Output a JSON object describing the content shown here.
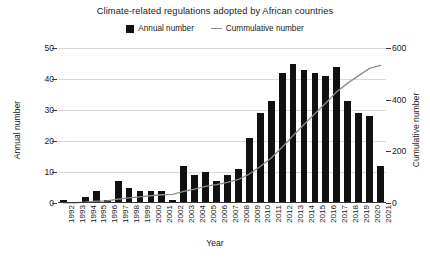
{
  "chart_data": {
    "type": "bar",
    "title": "Climate-related regulations adopted by African countries",
    "xlabel": "Year",
    "ylabel": "Annual number",
    "y2label": "Cumulative number",
    "grid": true,
    "legend_position": "top-center",
    "ylim": [
      0,
      50
    ],
    "y2lim": [
      0,
      600
    ],
    "yticks": [
      0,
      10,
      20,
      30,
      40,
      50
    ],
    "y2ticks": [
      0,
      200,
      400,
      600
    ],
    "categories": [
      "1992",
      "1993",
      "1994",
      "1995",
      "1996",
      "1997",
      "1998",
      "1999",
      "2000",
      "2001",
      "2002",
      "2003",
      "2004",
      "2005",
      "2006",
      "2007",
      "2008",
      "2009",
      "2010",
      "2011",
      "2012",
      "2013",
      "2014",
      "2015",
      "2016",
      "2017",
      "2018",
      "2019",
      "2020",
      "2021"
    ],
    "series": [
      {
        "name": "Annual number",
        "type": "bar",
        "axis": "left",
        "color": "#111111",
        "values": [
          1,
          0,
          2,
          4,
          1,
          7,
          5,
          4,
          4,
          4,
          1,
          12,
          9,
          10,
          7,
          9,
          11,
          21,
          29,
          33,
          42,
          45,
          43,
          42,
          41,
          44,
          33,
          29,
          28,
          12
        ]
      },
      {
        "name": "Cummulative number",
        "type": "line",
        "axis": "right",
        "color": "#8d8d8d",
        "values": [
          12,
          12,
          36,
          84,
          96,
          180,
          240,
          288,
          336,
          384,
          396,
          408,
          420,
          432,
          444,
          456,
          468,
          480,
          498,
          516,
          534,
          552,
          570,
          588,
          606,
          624,
          642,
          654,
          660,
          664
        ]
      }
    ],
    "cumulative_right_axis_values": [
      1,
      1,
      3,
      7,
      8,
      15,
      20,
      24,
      28,
      32,
      33,
      45,
      54,
      64,
      71,
      80,
      91,
      112,
      141,
      174,
      216,
      261,
      304,
      346,
      387,
      431,
      464,
      493,
      521,
      533
    ]
  },
  "legend": {
    "entries": [
      {
        "label": "Annual number",
        "marker": "bar-swatch-icon"
      },
      {
        "label": "Cummulative number",
        "marker": "line-swatch-icon"
      }
    ]
  },
  "caption": {
    "fragment": ""
  }
}
